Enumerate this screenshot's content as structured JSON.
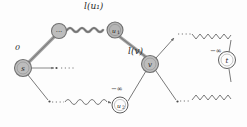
{
  "figure": {
    "type": "graph-diagram",
    "background": "#fdfdfd",
    "node_fill": "#b9b9b9",
    "node_stroke": "#6f6f6f",
    "edge_color": "#6a6a6a",
    "thick_edge_color": "#9a9a9a",
    "text_color": "#1c1c1c"
  },
  "nodes": [
    {
      "id": "s",
      "label": "s",
      "x": 23,
      "y": 68,
      "r": 8.5,
      "filled": true,
      "kind": "source"
    },
    {
      "id": "dots_top",
      "label": "···",
      "x": 59,
      "y": 31,
      "r": 7.5,
      "filled": true,
      "kind": "ellipsis"
    },
    {
      "id": "u1",
      "label": "u",
      "sub": "1",
      "x": 115,
      "y": 30,
      "r": 8.0,
      "filled": true,
      "kind": "inner"
    },
    {
      "id": "v",
      "label": "v",
      "x": 150,
      "y": 64,
      "r": 8.5,
      "filled": true,
      "kind": "inner"
    },
    {
      "id": "u2",
      "label": "u",
      "sub": "2",
      "x": 120,
      "y": 105,
      "r": 8.0,
      "filled": false,
      "kind": "inner"
    },
    {
      "id": "t",
      "label": "t",
      "x": 227,
      "y": 60,
      "r": 8.5,
      "filled": false,
      "kind": "sink"
    }
  ],
  "edge_labels": {
    "l_u1": "l(u₁)",
    "l_v": "l(v)",
    "zero": "0",
    "neg_inf_u2": "−∞",
    "neg_inf_t": "−∞"
  },
  "edges": [
    {
      "from": "s",
      "to": "dots_top",
      "style": "thick-solid",
      "label": "0"
    },
    {
      "from": "dots_top",
      "to": "u1",
      "style": "wavy",
      "label": "l(u₁)"
    },
    {
      "from": "u1",
      "to": "v",
      "style": "thick-solid",
      "label": ""
    },
    {
      "from": "s",
      "to": "dots_mid",
      "style": "solid-arrow-dotted",
      "label": ""
    },
    {
      "from": "s",
      "to": "u2",
      "style": "solid-then-wavy",
      "label": ""
    },
    {
      "from": "u2",
      "to": "v",
      "style": "solid",
      "label": "−∞"
    },
    {
      "from": "v",
      "to": "t",
      "style": "solid-dotted-zigzag-upper",
      "label": ""
    },
    {
      "from": "v",
      "to": "t",
      "style": "solid-dotted-zigzag-lower",
      "label": "−∞"
    }
  ]
}
